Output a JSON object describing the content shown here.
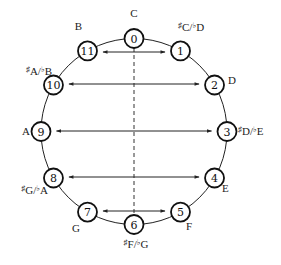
{
  "diagram": {
    "center": [
      134,
      131.5
    ],
    "radius": 93,
    "node_radius": 9.5,
    "nodes": [
      {
        "id": 0,
        "num": "0",
        "note": "C",
        "sharp": "",
        "flat": "",
        "label_pos": [
          134,
          17
        ],
        "anchor": "middle"
      },
      {
        "id": 1,
        "num": "1",
        "note": "C/D",
        "sharp": "♯C",
        "flat": "♭D",
        "label_pos": [
          178,
          31
        ],
        "anchor": "start"
      },
      {
        "id": 2,
        "num": "2",
        "note": "D",
        "sharp": "",
        "flat": "",
        "label_pos": [
          228,
          84
        ],
        "anchor": "start"
      },
      {
        "id": 3,
        "num": "3",
        "note": "D/E",
        "sharp": "♯D",
        "flat": "♭E",
        "label_pos": [
          238,
          135
        ],
        "anchor": "start"
      },
      {
        "id": 4,
        "num": "4",
        "note": "E",
        "sharp": "",
        "flat": "",
        "label_pos": [
          222,
          192
        ],
        "anchor": "start"
      },
      {
        "id": 5,
        "num": "5",
        "note": "F",
        "sharp": "",
        "flat": "",
        "label_pos": [
          186,
          230
        ],
        "anchor": "start"
      },
      {
        "id": 6,
        "num": "6",
        "note": "F/G",
        "sharp": "♯F",
        "flat": "♭G",
        "label_pos": [
          136,
          248
        ],
        "anchor": "middle"
      },
      {
        "id": 7,
        "num": "7",
        "note": "G",
        "sharp": "",
        "flat": "",
        "label_pos": [
          80,
          232
        ],
        "anchor": "end"
      },
      {
        "id": 8,
        "num": "8",
        "note": "G/A",
        "sharp": "♯G",
        "flat": "♭A",
        "label_pos": [
          48,
          194
        ],
        "anchor": "end"
      },
      {
        "id": 9,
        "num": "9",
        "note": "A",
        "sharp": "",
        "flat": "",
        "label_pos": [
          30,
          135
        ],
        "anchor": "end"
      },
      {
        "id": 10,
        "num": "10",
        "note": "A/B",
        "sharp": "♯A",
        "flat": "♭B",
        "label_pos": [
          52,
          75
        ],
        "anchor": "end"
      },
      {
        "id": 11,
        "num": "11",
        "note": "B",
        "sharp": "",
        "flat": "",
        "label_pos": [
          82,
          30
        ],
        "anchor": "end"
      }
    ],
    "arrows": [
      {
        "from": 11,
        "to": 1,
        "y": 52
      },
      {
        "from": 10,
        "to": 2,
        "y": 84
      },
      {
        "from": 9,
        "to": 3,
        "y": 131
      },
      {
        "from": 8,
        "to": 4,
        "y": 177
      },
      {
        "from": 7,
        "to": 5,
        "y": 211
      }
    ],
    "axis": {
      "from": 0,
      "to": 6,
      "style": "dashed"
    },
    "colors": {
      "stroke": "#111111",
      "background": "#ffffff"
    }
  }
}
